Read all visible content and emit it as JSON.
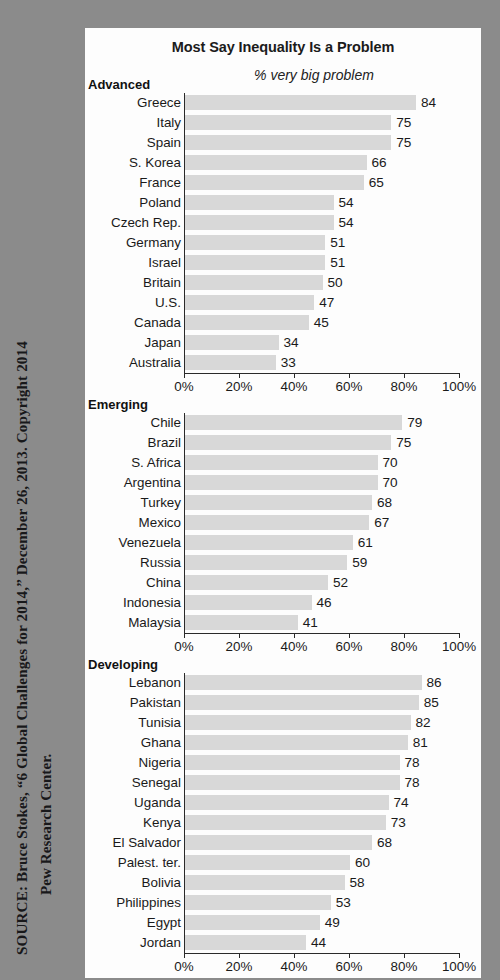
{
  "source_note": {
    "line1": "SOURCE: Bruce Stokes, “6 Global Challenges for 2014,” December 26, 2013. Copyright 2014",
    "line2": "Pew Research Center."
  },
  "chart_panel": {
    "title": "Most Say Inequality Is a Problem",
    "subtitle": "% very big problem"
  },
  "axis": {
    "ticks": [
      "0%",
      "20%",
      "40%",
      "60%",
      "80%",
      "100%"
    ],
    "tick_values": [
      0,
      20,
      40,
      60,
      80,
      100
    ]
  },
  "colors": {
    "background": "#8b8b8b",
    "panel": "#fdfdfd",
    "bar": "#d8d8d8",
    "axis": "#2a2a2a",
    "text": "#1a1a1a"
  },
  "chart_data": {
    "type": "bar",
    "title": "Most Say Inequality Is a Problem",
    "subtitle": "% very big problem",
    "xlabel": "",
    "ylabel": "",
    "xlim": [
      0,
      100
    ],
    "orientation": "horizontal",
    "grid": false,
    "legend": "none",
    "axis_ticks": [
      0,
      20,
      40,
      60,
      80,
      100
    ],
    "axis_tick_labels": [
      "0%",
      "20%",
      "40%",
      "60%",
      "80%",
      "100%"
    ],
    "groups": [
      {
        "name": "Advanced",
        "categories": [
          "Greece",
          "Italy",
          "Spain",
          "S. Korea",
          "France",
          "Poland",
          "Czech Rep.",
          "Germany",
          "Israel",
          "Britain",
          "U.S.",
          "Canada",
          "Japan",
          "Australia"
        ],
        "values": [
          84,
          75,
          75,
          66,
          65,
          54,
          54,
          51,
          51,
          50,
          47,
          45,
          34,
          33
        ]
      },
      {
        "name": "Emerging",
        "categories": [
          "Chile",
          "Brazil",
          "S. Africa",
          "Argentina",
          "Turkey",
          "Mexico",
          "Venezuela",
          "Russia",
          "China",
          "Indonesia",
          "Malaysia"
        ],
        "values": [
          79,
          75,
          70,
          70,
          68,
          67,
          61,
          59,
          52,
          46,
          41
        ]
      },
      {
        "name": "Developing",
        "categories": [
          "Lebanon",
          "Pakistan",
          "Tunisia",
          "Ghana",
          "Nigeria",
          "Senegal",
          "Uganda",
          "Kenya",
          "El Salvador",
          "Palest. ter.",
          "Bolivia",
          "Philippines",
          "Egypt",
          "Jordan"
        ],
        "values": [
          86,
          85,
          82,
          81,
          78,
          78,
          74,
          73,
          68,
          60,
          58,
          53,
          49,
          44
        ]
      }
    ]
  }
}
